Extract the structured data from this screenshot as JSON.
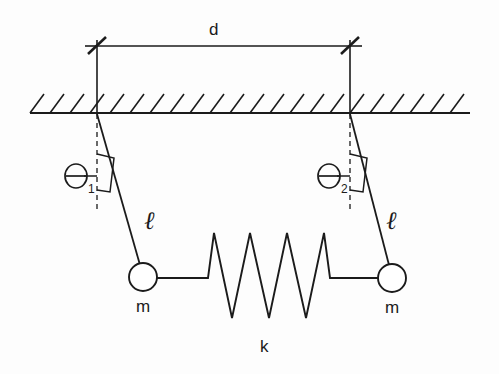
{
  "figure": {
    "type": "physics-diagram",
    "width": 499,
    "height": 374,
    "background_color": "#fdfdfd",
    "line_color": "#1b1b1b"
  },
  "labels": {
    "separation": "d",
    "left_angle": "Θ",
    "left_angle_subscript": "1",
    "right_angle": "Θ",
    "right_angle_subscript": "2",
    "left_length": "ℓ",
    "right_length": "ℓ",
    "left_mass": "m",
    "right_mass": "m",
    "spring_constant": "k"
  },
  "geometry": {
    "ceiling": {
      "y": 113,
      "x_start": 30,
      "x_end": 470,
      "hatch_count": 22,
      "hatch_length": 20,
      "hatch_angle_deg": 45
    },
    "dimension_line": {
      "y": 46,
      "x_left": 97,
      "x_right": 350,
      "extension_top": 46,
      "extension_bottom": 113,
      "tick_style": "slash"
    },
    "left_pendulum": {
      "pivot_x": 97,
      "pivot_y": 114,
      "bob_x": 143,
      "bob_y": 277,
      "bob_radius": 14,
      "dashed_vertical_end_y": 212,
      "angle_label_x": 68,
      "angle_label_y": 170
    },
    "right_pendulum": {
      "pivot_x": 350,
      "pivot_y": 114,
      "bob_x": 392,
      "bob_y": 278,
      "bob_radius": 14,
      "dashed_vertical_end_y": 212,
      "angle_label_x": 321,
      "angle_label_y": 170
    },
    "spring": {
      "lead_y": 278,
      "left_lead_start_x": 157,
      "left_lead_end_x": 208,
      "right_lead_start_x": 330,
      "right_lead_end_x": 378,
      "peak_y": 233,
      "valley_y": 318,
      "peaks_x": [
        214,
        250,
        287,
        324
      ],
      "valleys_x": [
        232,
        269,
        306
      ],
      "coil_count": 4
    }
  }
}
